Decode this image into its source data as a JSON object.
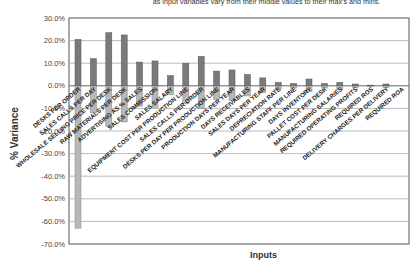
{
  "chart_data": {
    "type": "bar",
    "title": "",
    "subtitle": "as input variables vary from their middle values to their max's and mins.",
    "xlabel": "Inputs",
    "ylabel": "% Variance",
    "ylim": [
      -70,
      30
    ],
    "yticks": [
      "30.0%",
      "20.0%",
      "10.0%",
      "0.0%",
      "-10.0%",
      "-20.0%",
      "-30.0%",
      "-40.0%",
      "-50.0%",
      "-60.0%",
      "-70.0%"
    ],
    "grid": true,
    "legend": "none",
    "categories": [
      "DESKS PER ORDER",
      "SALES CALLS PER DAY",
      "WHOLESALE SELLING PRICE PER DESK",
      "RAW MATERIALS PER DESK",
      "ADVERTISING AS % SALES",
      "SALES COMMISSION",
      "SALES SALARY",
      "EQUIPMENT COST PER PRODUCTION LINE",
      "SALES CALLS PER ORDER",
      "DESKS PER DAY PER PRODUCTION LINE",
      "PRODUCTION DAYS PER YEAR",
      "DAYS RECEIVABLES",
      "SALES DAYS PER YEAR",
      "DEPRECIATION RATE",
      "MANUFACTURING STAFF PER LINE",
      "DAYS INVENTORY",
      "PALLET COST PER DESK",
      "MANUFACTURING SALARIES",
      "REQUIRED OPERATING PROFITS",
      "REQUIRED ROS",
      "DELIVERY CHARGES PER DELIVERY",
      "REQUIRED ROA"
    ],
    "series": [
      {
        "name": "Max",
        "color": "#7a7a7a",
        "values": [
          20.5,
          12.0,
          23.5,
          22.5,
          10.5,
          11.0,
          4.5,
          10.0,
          13.0,
          6.5,
          7.0,
          5.0,
          3.5,
          1.5,
          1.0,
          3.0,
          1.0,
          1.5,
          0.8,
          0.3,
          0.8,
          0.0
        ]
      },
      {
        "name": "Min",
        "color": "#b8b8b8",
        "values": [
          -63.0,
          -12.0,
          -18.0,
          -16.0,
          -9.0,
          -9.5,
          -4.0,
          -8.0,
          -10.0,
          -6.0,
          -6.5,
          -4.5,
          -3.0,
          -1.5,
          -1.0,
          -2.5,
          -1.0,
          -1.5,
          -0.8,
          -0.3,
          -0.8,
          0.0
        ]
      }
    ]
  }
}
